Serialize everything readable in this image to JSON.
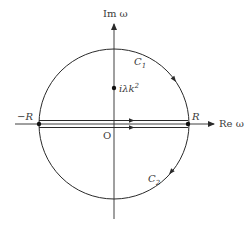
{
  "diagram": {
    "type": "complex-plane contour",
    "axes": {
      "x_label": "Re ω",
      "y_label": "Im ω",
      "origin_label": "O"
    },
    "circle": {
      "center": [
        114,
        124
      ],
      "radius": 75
    },
    "points": {
      "left_label": "−R",
      "right_label": "R",
      "pole_label_prefix": "iλk",
      "pole_label_sup": "2"
    },
    "contours": {
      "upper": {
        "label": "C",
        "sub": "1"
      },
      "lower": {
        "label": "C",
        "sub": "2"
      }
    },
    "colors": {
      "stroke": "#2a2a2a",
      "background": "#ffffff"
    }
  }
}
